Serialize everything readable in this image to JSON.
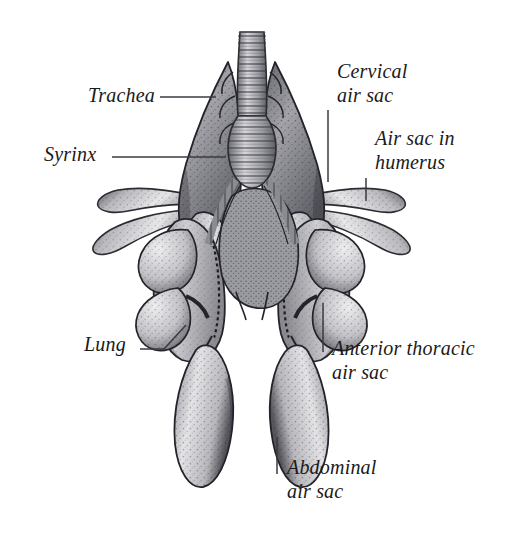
{
  "figure": {
    "background_color": "#ffffff",
    "ink_color": "#1a1a1a",
    "leader_color": "#3a3a42",
    "labels": [
      {
        "id": "trachea",
        "text": "Trachea",
        "lines": [
          "Trachea"
        ],
        "x": 88,
        "y": 84,
        "align": "left"
      },
      {
        "id": "syrinx",
        "text": "Syrinx",
        "lines": [
          "Syrinx"
        ],
        "x": 44,
        "y": 143,
        "align": "left"
      },
      {
        "id": "cervical-air-sac",
        "text": "Cervical air sac",
        "lines": [
          "Cervical",
          "air sac"
        ],
        "x": 337,
        "y": 60,
        "align": "left"
      },
      {
        "id": "air-sac-in-humerus",
        "text": "Air sac in humerus",
        "lines": [
          "Air sac in",
          "humerus"
        ],
        "x": 375,
        "y": 127,
        "align": "left"
      },
      {
        "id": "anterior-thoracic-air-sac",
        "text": "Anterior thoracic air sac",
        "lines": [
          "Anterior thoracic",
          "air sac"
        ],
        "x": 332,
        "y": 337,
        "align": "left"
      },
      {
        "id": "abdominal-air-sac",
        "text": "Abdominal air sac",
        "lines": [
          "Abdominal",
          "air sac"
        ],
        "x": 287,
        "y": 456,
        "align": "left"
      },
      {
        "id": "lung",
        "text": "Lung",
        "lines": [
          "Lung"
        ],
        "x": 84,
        "y": 333,
        "align": "left"
      }
    ],
    "leaders": [
      {
        "id": "leader-trachea",
        "points": "160,97 216,97"
      },
      {
        "id": "leader-syrinx",
        "points": "112,157 226,157"
      },
      {
        "id": "leader-cervical",
        "points": "328,110 328,182"
      },
      {
        "id": "leader-humerus",
        "points": "366,178 366,201"
      },
      {
        "id": "leader-anterior-thoracic",
        "points": "323,303 323,352"
      },
      {
        "id": "leader-abdominal",
        "points": "277,437 277,474"
      },
      {
        "id": "leader-lung",
        "points": "140,349 164,349 186,325"
      }
    ],
    "anatomy_parts": [
      "trachea",
      "syrinx",
      "bronchi",
      "cervical-air-sac-left",
      "cervical-air-sac-right",
      "humeral-air-sac-left",
      "humeral-air-sac-right",
      "anterior-thoracic-air-sac-left",
      "anterior-thoracic-air-sac-right",
      "posterior-thoracic-air-sac-left",
      "posterior-thoracic-air-sac-right",
      "lung-left",
      "lung-right",
      "abdominal-air-sac-left",
      "abdominal-air-sac-right"
    ]
  }
}
